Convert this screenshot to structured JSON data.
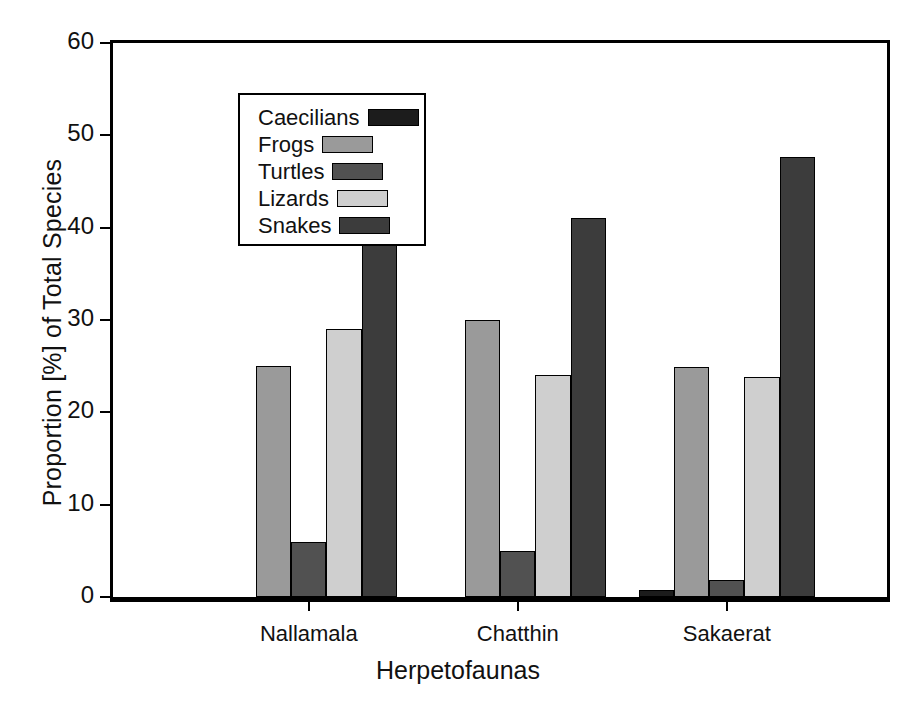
{
  "chart_data": {
    "type": "bar",
    "title": "",
    "xlabel": "Herpetofaunas",
    "ylabel": "Proportion [%] of Total Species",
    "categories": [
      "Nallamala",
      "Chatthin",
      "Sakaerat"
    ],
    "series": [
      {
        "name": "Caecilians",
        "color": "#1c1c1c",
        "values": [
          0,
          0,
          0.8
        ]
      },
      {
        "name": "Frogs",
        "color": "#9a9a9a",
        "values": [
          25,
          30,
          24.9
        ]
      },
      {
        "name": "Turtles",
        "color": "#515151",
        "values": [
          6,
          5,
          1.8
        ]
      },
      {
        "name": "Lizards",
        "color": "#cfcfcf",
        "values": [
          29,
          24,
          23.8
        ]
      },
      {
        "name": "Snakes",
        "color": "#3c3c3c",
        "values": [
          40,
          41,
          47.7
        ]
      }
    ],
    "ylim": [
      0,
      60
    ],
    "yticks": [
      0,
      10,
      20,
      30,
      40,
      50,
      60
    ],
    "ytick_labels": [
      "0",
      "10",
      "20",
      "30",
      "40",
      "50",
      "60"
    ],
    "grid": false,
    "legend_position": "upper-left",
    "legend_entries": [
      "Caecilians",
      "Frogs",
      "Turtles",
      "Lizards",
      "Snakes"
    ]
  }
}
